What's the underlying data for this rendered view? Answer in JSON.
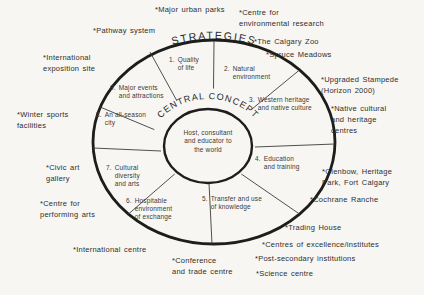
{
  "diagram": {
    "curved_title_outer": "STRATEGIES",
    "curved_title_inner": "CENTRAL CONCEPT",
    "hub": "Host, consultant\nand educator to\nthe world",
    "segments": [
      {
        "num": "1.",
        "label": "Quality\nof life"
      },
      {
        "num": "2.",
        "label": "Natural\nenvironment"
      },
      {
        "num": "3.",
        "label": "Western heritage\nand native culture"
      },
      {
        "num": "4.",
        "label": "Education\nand training"
      },
      {
        "num": "5.",
        "label": "Transfer and use\nof knowledge"
      },
      {
        "num": "6.",
        "label": "Hospitable\nenvironment\nof exchange"
      },
      {
        "num": "7.",
        "label": "Cultural\ndiversity\nand arts"
      },
      {
        "num": "8.",
        "label": "An all-season\ncity"
      },
      {
        "num": "9.",
        "label": "Major events\nand attractions"
      }
    ],
    "strategies": [
      "*Major urban parks",
      "*Centre for\nenvironmental research",
      "*The Calgary Zoo",
      "*Spruce Meadows",
      "*Upgraded Stampede\n(Horizon 2000)",
      "*Native cultural\nand heritage\ncentres",
      "*Glenbow, Heritage\nPark, Fort Calgary",
      "*Cochrane Ranche",
      "*Trading House",
      "*Centres of excellence/institutes",
      "*Post-secondary institutions",
      "*Science centre",
      "*Conference\nand trade centre",
      "*International centre",
      "*Centre for\nperforming arts",
      "*Civic art\ngallery",
      "*Winter sports\nfacilities",
      "*International\nexposition site",
      "*Pathway system"
    ]
  }
}
